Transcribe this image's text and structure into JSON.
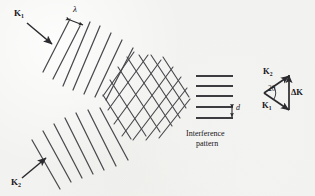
{
  "figure": {
    "background_color": "#f2f2f0",
    "ink_color": "#3a3a3e",
    "width": 315,
    "height": 196
  },
  "labels": {
    "k1_wave": "K",
    "k1_wave_sub": "1",
    "k2_wave": "K",
    "k2_wave_sub": "2",
    "wavelength": "λ",
    "fringe_spacing": "d",
    "caption_line1": "Interference",
    "caption_line2": "pattern",
    "vector_k2": "K",
    "vector_k2_sub": "2",
    "vector_k1": "K",
    "vector_k1_sub": "1",
    "vector_delta_k": "ΔK",
    "angle": "2θ"
  },
  "wave_groups": [
    {
      "name": "upper-left-beam",
      "wavefront_count": 7,
      "tilt_degrees": -60,
      "propagation_label": "K1",
      "arrow_direction": "down-right"
    },
    {
      "name": "lower-left-beam",
      "wavefront_count": 7,
      "tilt_degrees": 60,
      "propagation_label": "K2",
      "arrow_direction": "up-right"
    }
  ],
  "interference_region": {
    "name": "crosshatch-overlap",
    "shape": "diamond",
    "description": "Region where the two sets of wavefronts cross forming a diamond lattice"
  },
  "fringe_panel": {
    "line_count": 5,
    "orientation": "horizontal",
    "spacing_label": "d"
  },
  "vector_diagram": {
    "type": "triangle",
    "vectors": [
      "K2",
      "K1",
      "ΔK"
    ],
    "apex_angle_label": "2θ",
    "delta_k_orientation": "vertical"
  }
}
